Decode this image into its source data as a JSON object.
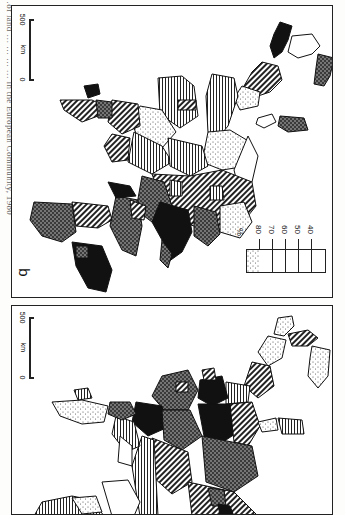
{
  "page": {
    "caption": "…of land … … … … in the European Community, 1980"
  },
  "legend": {
    "unit": "%",
    "ticks": [
      "80",
      "70",
      "60",
      "50",
      "40"
    ],
    "classes": [
      {
        "name": "above-80",
        "pattern": "solid-black"
      },
      {
        "name": "70-80",
        "pattern": "crosshatch"
      },
      {
        "name": "60-70",
        "pattern": "diagonal-hatch"
      },
      {
        "name": "50-60",
        "pattern": "vertical-lines"
      },
      {
        "name": "40-50",
        "pattern": "stipple"
      },
      {
        "name": "below-40",
        "pattern": "white"
      }
    ]
  },
  "panels": [
    {
      "id": "b",
      "label": "b",
      "scale": {
        "start": "0",
        "unit": "km",
        "end": "500"
      },
      "has_legend": true
    },
    {
      "id": "a",
      "label": "a",
      "scale": {
        "start": "0",
        "unit": "km",
        "end": "500"
      },
      "has_legend": false
    }
  ]
}
